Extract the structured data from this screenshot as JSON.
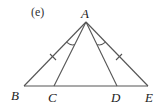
{
  "figure": {
    "tag": "(e)",
    "points": {
      "A": {
        "label": "A",
        "x": 86,
        "y": 22
      },
      "B": {
        "label": "B",
        "x": 24,
        "y": 86
      },
      "C": {
        "label": "C",
        "x": 54,
        "y": 86
      },
      "D": {
        "label": "D",
        "x": 117,
        "y": 86
      },
      "E": {
        "label": "E",
        "x": 148,
        "y": 86
      }
    },
    "segments": [
      "AB",
      "AC",
      "AD",
      "AE",
      "BE"
    ],
    "congruent_sides": [
      "AB",
      "AE"
    ],
    "congruent_angles": [
      "BAC",
      "DAE"
    ],
    "line_color": "#555555"
  }
}
